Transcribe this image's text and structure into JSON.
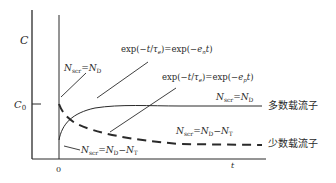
{
  "axes": {
    "y_label": "C",
    "y_tick_label": "C0",
    "x_label": "t",
    "x_origin_label": "0"
  },
  "annotations": {
    "nscr_nd_top": "Nscr = ND",
    "exp_en": "exp(−t/τe) = exp(−ent)",
    "exp_ep": "exp(−t/τe) = exp(−ept)",
    "nscr_nd_right": "Nscr = ND",
    "nscr_nd_nt_right": "Nscr = ND − NT",
    "nscr_nd_nt_bottom": "Nscr = ND − NT"
  },
  "legend": {
    "majority": "多数载流子",
    "minority": "少数载流子"
  },
  "curves": {
    "majority_style": "solid",
    "minority_style": "dashed",
    "stroke_color": "#2a2a2a"
  }
}
